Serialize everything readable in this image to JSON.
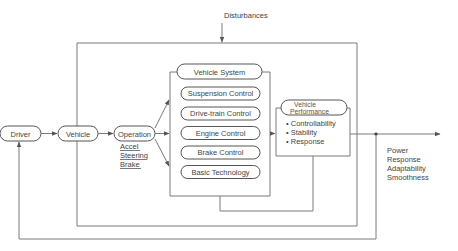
{
  "diagram": {
    "disturbances_label": "Disturbances",
    "nodes": {
      "driver": "Driver",
      "vehicle": "Vehicle",
      "operation": "Operation",
      "vehicle_system": "Vehicle System",
      "vehicle_performance_line1": "Vehicle",
      "vehicle_performance_line2": "Performance"
    },
    "operation_inputs": [
      "Accel",
      "Steering",
      "Brake"
    ],
    "vehicle_system_components": [
      "Suspension Control",
      "Drive-train Control",
      "Engine Control",
      "Brake Control",
      "Basic Technology"
    ],
    "performance_attributes": [
      "• Controllability",
      "• Stability",
      "• Response"
    ],
    "output_attributes": [
      "Power",
      "Response",
      "Adaptability",
      "Smoothness"
    ]
  }
}
